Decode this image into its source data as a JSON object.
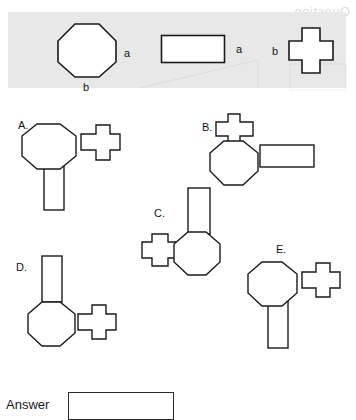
{
  "legend": {
    "shapes": [
      {
        "name": "octagon",
        "icon": "octagon-shape",
        "label_right": "a",
        "label_bottom": "b"
      },
      {
        "name": "rectangle",
        "icon": "rectangle-shape",
        "label_right": "a"
      },
      {
        "name": "cross",
        "icon": "cross-shape",
        "label_left": "b"
      }
    ]
  },
  "options": [
    {
      "letter": "A.",
      "description": "octagon with cross attached on right side and vertical rectangle hanging below"
    },
    {
      "letter": "B.",
      "description": "octagon with cross attached on top and horizontal rectangle on right side"
    },
    {
      "letter": "C.",
      "description": "octagon with vertical rectangle on top and cross attached on left side"
    },
    {
      "letter": "D.",
      "description": "octagon with vertical rectangle on top and cross attached on right side"
    },
    {
      "letter": "E.",
      "description": "octagon with cross attached on right side and vertical rectangle hanging below"
    }
  ],
  "answer": {
    "label": "Answer",
    "value": "",
    "placeholder": ""
  },
  "artifacts": {
    "watermark": "Question"
  },
  "colors": {
    "banner_background": "#e8e8e8",
    "stroke": "#1a1a1a",
    "page_background": "#ffffff",
    "shape_fill": "#ffffff"
  }
}
